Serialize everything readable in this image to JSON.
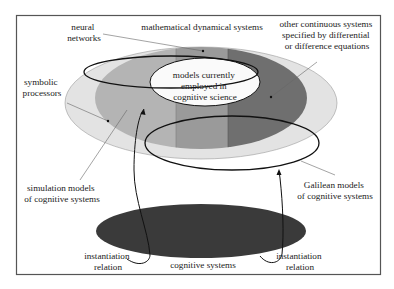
{
  "diagram": {
    "colors": {
      "frame": "#555555",
      "outer_ellipse": "#e3e3e3",
      "symbolic_region": "#b4b4b4",
      "neural_band": "#9a9a9a",
      "continuous_region": "#6f6f6f",
      "models_current": "#fafafa",
      "cognitive_systems": "#3a3a3a",
      "outline": "#111111"
    },
    "labels": {
      "neural_networks": [
        "neural",
        "networks"
      ],
      "mathematical_dynamical_systems": "mathematical dynamical systems",
      "other_continuous": [
        "other continuous systems",
        "specified by differential",
        "or difference equations"
      ],
      "symbolic_processors": [
        "symbolic",
        "processors"
      ],
      "models_current": [
        "models currently",
        "employed in",
        "cognitive science"
      ],
      "simulation_models": [
        "simulation models",
        "of cognitive systems"
      ],
      "galilean_models": [
        "Galilean models",
        "of cognitive systems"
      ],
      "instantiation_left": [
        "instantiation",
        "relation"
      ],
      "instantiation_right": [
        "instantiation",
        "relation"
      ],
      "cognitive_systems": "cognitive systems"
    }
  }
}
